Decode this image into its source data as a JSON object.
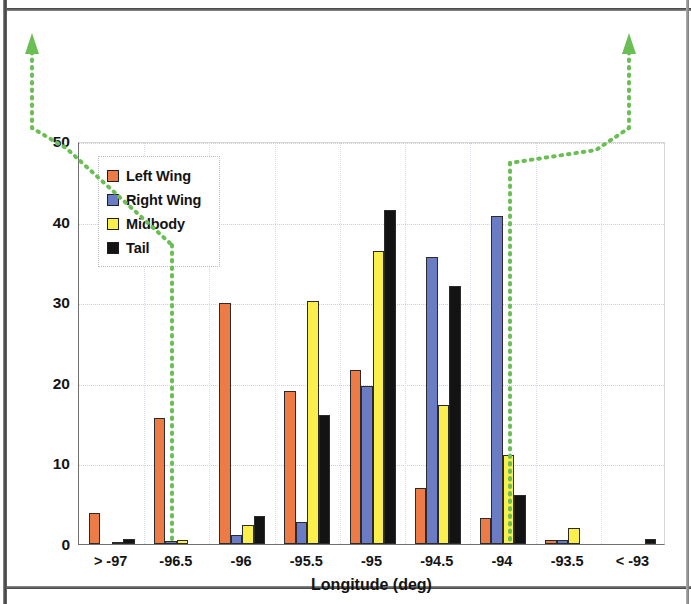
{
  "chart_data": {
    "type": "bar",
    "title": "",
    "xlabel": "Longitude (deg)",
    "ylabel": "Percent of Debris per Bin",
    "categories": [
      "> -97",
      "-96.5",
      "-96",
      "-95.5",
      "-95",
      "-94.5",
      "-94",
      "-93.5",
      "< -93"
    ],
    "series": [
      {
        "name": "Left Wing",
        "color": "#ED7B46",
        "values": [
          3.9,
          15.6,
          29.9,
          19.0,
          21.6,
          7.0,
          3.2,
          0.5,
          0.0
        ]
      },
      {
        "name": "Right Wing",
        "color": "#6C7CC4",
        "values": [
          0.0,
          0.4,
          1.1,
          2.7,
          19.6,
          35.6,
          40.7,
          0.5,
          0.0
        ]
      },
      {
        "name": "Midbody",
        "color": "#FBF04B",
        "values": [
          0.2,
          0.5,
          2.4,
          30.2,
          36.4,
          17.3,
          11.1,
          2.0,
          0.0
        ]
      },
      {
        "name": "Tail",
        "color": "#131313",
        "values": [
          0.6,
          0.0,
          3.5,
          16.0,
          41.4,
          32.0,
          6.1,
          0.0,
          0.6
        ]
      }
    ],
    "ylim": [
      0,
      50
    ],
    "yticks": [
      0,
      10,
      20,
      30,
      40,
      50
    ],
    "grid": true,
    "legend_position": "top-left",
    "legend_entries": [
      "Left Wing",
      "Right Wing",
      "Midbody",
      "Tail"
    ],
    "annotations": [
      {
        "name": "left-callout-arrow",
        "color": "#6ABE54",
        "style": "dotted-arrow"
      },
      {
        "name": "right-callout-arrow",
        "color": "#6ABE54",
        "style": "dotted-arrow"
      }
    ]
  },
  "colors": {
    "left_wing": "#ED7B46",
    "right_wing": "#6C7CC4",
    "midbody": "#FBF04B",
    "tail": "#131313",
    "annotation_green": "#6ABE54",
    "axis": "#6f6f6f",
    "gridline": "#cfcfcf"
  }
}
